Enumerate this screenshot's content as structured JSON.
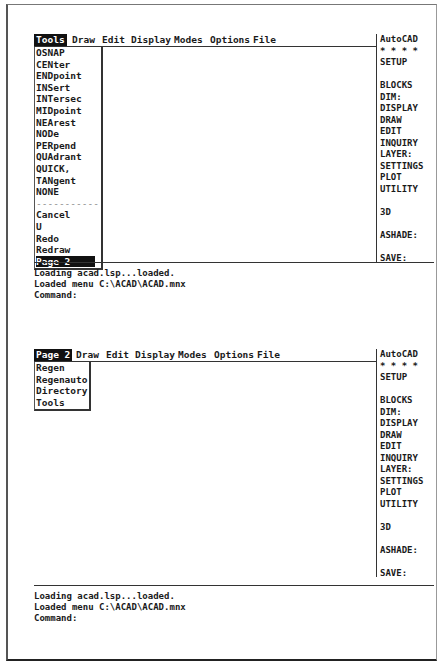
{
  "screens": [
    {
      "menubar": {
        "items": [
          {
            "label": "Tools",
            "selected": true
          },
          {
            "label": "Draw"
          },
          {
            "label": "Edit"
          },
          {
            "label": "Display"
          },
          {
            "label": "Modes"
          },
          {
            "label": "Options"
          },
          {
            "label": "File"
          }
        ]
      },
      "dropdown": {
        "items": [
          "OSNAP",
          "CENter",
          "ENDpoint",
          "INSert",
          "INTersec",
          "MIDpoint",
          "NEArest",
          "NODe",
          "PERpend",
          "QUAdrant",
          "QUICK,",
          "TANgent",
          "NONE",
          "-----------",
          "Cancel",
          "U",
          "Redo",
          "Redraw",
          "Page 2"
        ],
        "highlighted": "Page 2"
      },
      "sidebar": {
        "items": [
          "AutoCAD",
          "* * * *",
          "SETUP",
          "",
          "BLOCKS",
          "DIM:",
          "DISPLAY",
          "DRAW",
          "EDIT",
          "INQUIRY",
          "LAYER:",
          "SETTINGS",
          "PLOT",
          "UTILITY",
          "",
          "3D",
          "",
          "ASHADE:",
          "",
          "SAVE:"
        ]
      },
      "command_area": {
        "lines": [
          "Loading acad.lsp...loaded.",
          "Loaded menu C:\\ACAD\\ACAD.mnx",
          "Command:"
        ]
      }
    },
    {
      "menubar": {
        "items": [
          {
            "label": "Page 2",
            "selected": true
          },
          {
            "label": "Draw"
          },
          {
            "label": "Edit"
          },
          {
            "label": "Display"
          },
          {
            "label": "Modes"
          },
          {
            "label": "Options"
          },
          {
            "label": "File"
          }
        ]
      },
      "dropdown": {
        "items": [
          "Regen",
          "Regenauto",
          "Directory",
          "Tools"
        ]
      },
      "sidebar": {
        "items": [
          "AutoCAD",
          "* * * *",
          "SETUP",
          "",
          "BLOCKS",
          "DIM:",
          "DISPLAY",
          "DRAW",
          "EDIT",
          "INQUIRY",
          "LAYER:",
          "SETTINGS",
          "PLOT",
          "UTILITY",
          "",
          "3D",
          "",
          "ASHADE:",
          "",
          "SAVE:"
        ]
      },
      "command_area": {
        "lines": [
          "Loading acad.lsp...loaded.",
          "Loaded menu C:\\ACAD\\ACAD.mnx",
          "Command:"
        ]
      }
    }
  ]
}
